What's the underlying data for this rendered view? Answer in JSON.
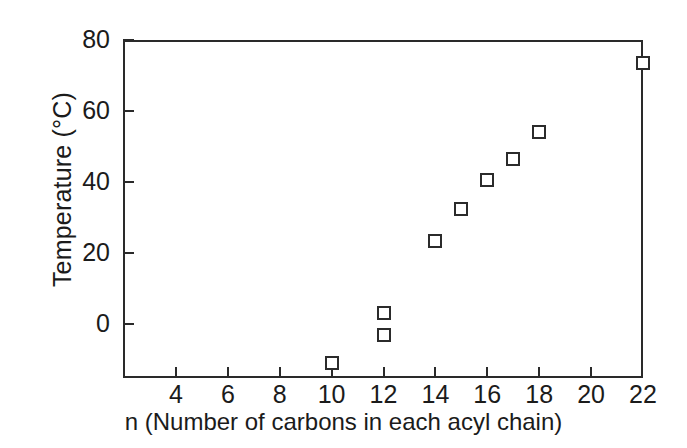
{
  "chart_data": {
    "type": "scatter",
    "title": "",
    "xlabel": "n (Number of carbons in each acyl chain)",
    "ylabel": "Temperature (°C)",
    "xlim": [
      2,
      22
    ],
    "ylim": [
      -15.2,
      80
    ],
    "grid": false,
    "legend": null,
    "marker_style": "open-square",
    "xticks": [
      4,
      6,
      8,
      10,
      12,
      14,
      16,
      18,
      20,
      22
    ],
    "xtick_labels": [
      "4",
      "6",
      "8",
      "10",
      "12",
      "14",
      "16",
      "18",
      "20",
      "22"
    ],
    "yticks": [
      0,
      20,
      40,
      60,
      80
    ],
    "ytick_labels": [
      "0",
      "20",
      "40",
      "60",
      "80"
    ],
    "points": [
      {
        "x": 10,
        "y": -11
      },
      {
        "x": 12,
        "y": 3
      },
      {
        "x": 12,
        "y": -3
      },
      {
        "x": 14,
        "y": 23.5
      },
      {
        "x": 15,
        "y": 32.5
      },
      {
        "x": 16,
        "y": 40.5
      },
      {
        "x": 17,
        "y": 46.5
      },
      {
        "x": 18,
        "y": 54
      },
      {
        "x": 22,
        "y": 73.5
      }
    ]
  },
  "colors": {
    "axis": "#2a2a2a",
    "marker_stroke": "#2b2b2b",
    "marker_fill": "#ffffff",
    "text": "#1b1b1b",
    "background": "#ffffff"
  }
}
